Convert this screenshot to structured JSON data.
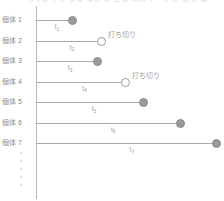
{
  "figure": {
    "top_cut_text": "打ち切り が ある 場合 の 生存 時間 データ の 模式 図",
    "axis_name": "time-axis"
  },
  "chart_data": {
    "type": "bar",
    "title": "",
    "xlabel": "",
    "ylabel": "",
    "categories": [
      "個体 1",
      "個体 2",
      "個体 3",
      "個体 4",
      "個体 5",
      "個体 6",
      "個体 7"
    ],
    "values": [
      36,
      65,
      61,
      89,
      107,
      144,
      180
    ],
    "series": [
      {
        "name": "observation-duration",
        "values": [
          36,
          65,
          61,
          89,
          107,
          144,
          180
        ]
      }
    ],
    "point_labels": [
      "t1",
      "t2",
      "t3",
      "t4",
      "t5",
      "t6",
      "t7"
    ],
    "point_label_subscripts": [
      "1",
      "2",
      "3",
      "4",
      "5",
      "6",
      "7"
    ],
    "point_label_base": "t",
    "event_status": [
      "event",
      "censored",
      "event",
      "censored",
      "event",
      "event",
      "event"
    ],
    "annotations": [
      "",
      "打ち切り",
      "",
      "打ち切り",
      "",
      "",
      ""
    ],
    "legend": [],
    "grid": false,
    "xlim": [
      0,
      188
    ]
  },
  "rows": [
    {
      "label": "個体 1",
      "t_base": "t",
      "t_sub": "1",
      "length": 36,
      "status": "event",
      "annotation": ""
    },
    {
      "label": "個体 2",
      "t_base": "t",
      "t_sub": "2",
      "length": 65,
      "status": "censored",
      "annotation": "打ち切り"
    },
    {
      "label": "個体 3",
      "t_base": "t",
      "t_sub": "3",
      "length": 61,
      "status": "event",
      "annotation": ""
    },
    {
      "label": "個体 4",
      "t_base": "t",
      "t_sub": "4",
      "length": 89,
      "status": "censored",
      "annotation": "打ち切り"
    },
    {
      "label": "個体 5",
      "t_base": "t",
      "t_sub": "5",
      "length": 107,
      "status": "event",
      "annotation": ""
    },
    {
      "label": "個体 6",
      "t_base": "t",
      "t_sub": "6",
      "length": 144,
      "status": "event",
      "annotation": ""
    },
    {
      "label": "個体 7",
      "t_base": "t",
      "t_sub": "7",
      "length": 180,
      "status": "event",
      "annotation": ""
    }
  ],
  "ellipsis": {
    "dot_count": 5
  },
  "colors": {
    "line": "#a9a9a9",
    "axis": "#b9b9b9",
    "filled_marker": "#9a9a9a",
    "open_marker": "#ffffff",
    "text": "#8a8a8a",
    "background": "#ffffff"
  }
}
